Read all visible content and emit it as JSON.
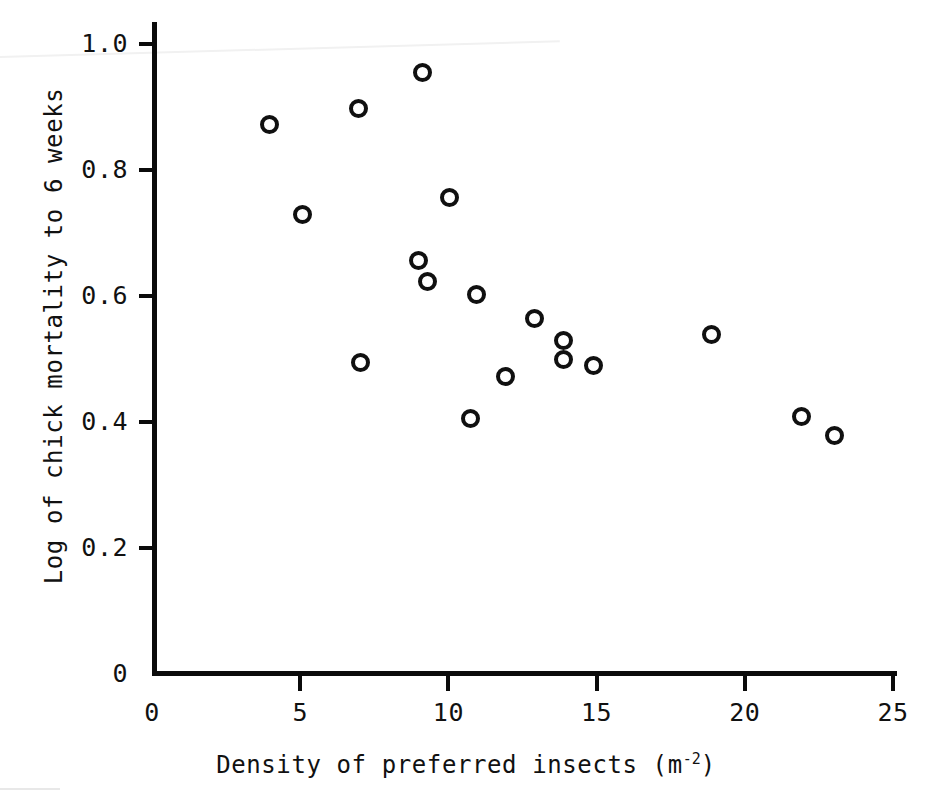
{
  "chart_data": {
    "type": "scatter",
    "title": "",
    "xlabel": "Density of preferred insects (m⁻²)",
    "ylabel": "Log of chick mortality to 6 weeks",
    "xlim": [
      0,
      26
    ],
    "ylim": [
      0,
      1.06
    ],
    "grid": false,
    "legend": null,
    "xticks": [
      0,
      5,
      10,
      15,
      20,
      25
    ],
    "xtick_labels": [
      "0",
      "5",
      "10",
      "15",
      "20",
      "25"
    ],
    "yticks": [
      0,
      0.2,
      0.4,
      0.6,
      0.8,
      1.0
    ],
    "ytick_labels": [
      "0",
      "0.2",
      "0.4",
      "0.6",
      "0.8",
      "1.0"
    ],
    "marker": "open-circle",
    "marker_color": "#101010",
    "n_points": 18,
    "x": [
      3.95,
      5.09,
      6.98,
      7.02,
      8.98,
      9.14,
      9.28,
      10.05,
      10.73,
      10.96,
      11.91,
      12.92,
      13.9,
      13.9,
      14.91,
      18.86,
      21.9,
      23.01
    ],
    "y": [
      0.873,
      0.73,
      0.898,
      0.494,
      0.656,
      0.955,
      0.623,
      0.756,
      0.406,
      0.602,
      0.472,
      0.564,
      0.529,
      0.5,
      0.49,
      0.539,
      0.409,
      0.379
    ],
    "points": [
      {
        "x": 3.95,
        "y": 0.873
      },
      {
        "x": 5.09,
        "y": 0.73
      },
      {
        "x": 6.98,
        "y": 0.898
      },
      {
        "x": 7.02,
        "y": 0.494
      },
      {
        "x": 8.98,
        "y": 0.656
      },
      {
        "x": 9.14,
        "y": 0.955
      },
      {
        "x": 9.28,
        "y": 0.623
      },
      {
        "x": 10.05,
        "y": 0.756
      },
      {
        "x": 10.73,
        "y": 0.406
      },
      {
        "x": 10.96,
        "y": 0.602
      },
      {
        "x": 11.91,
        "y": 0.472
      },
      {
        "x": 12.92,
        "y": 0.564
      },
      {
        "x": 13.9,
        "y": 0.529
      },
      {
        "x": 13.9,
        "y": 0.5
      },
      {
        "x": 14.91,
        "y": 0.49
      },
      {
        "x": 18.86,
        "y": 0.539
      },
      {
        "x": 21.9,
        "y": 0.409
      },
      {
        "x": 23.01,
        "y": 0.379
      }
    ]
  },
  "axes": {
    "x_title_main": "Density of preferred insects (m",
    "x_title_sup": "-2",
    "x_title_tail": ")",
    "y_title": "Log of chick mortality to 6 weeks"
  },
  "colors": {
    "ink": "#101010",
    "background": "#ffffff"
  },
  "plot_geometry": {
    "x_pixel_at_0": 152,
    "x_pixel_at_25": 893,
    "y_pixel_at_1": 44,
    "y_pixel_at_0p2": 548
  }
}
